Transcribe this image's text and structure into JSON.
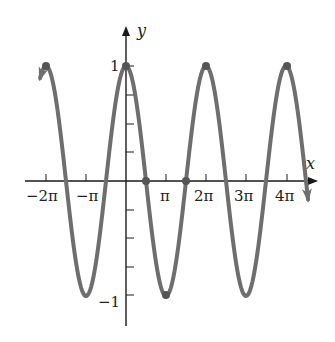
{
  "chart_data": {
    "type": "line",
    "title": "",
    "function": "y = cos(x)",
    "xlabel": "x",
    "ylabel": "y",
    "xlim": [
      -6.9,
      14.4
    ],
    "ylim": [
      -1.35,
      1.35
    ],
    "grid": false,
    "legend": null,
    "x_ticks": [
      {
        "value": -6.2832,
        "label": "−2π"
      },
      {
        "value": -3.1416,
        "label": "−π"
      },
      {
        "value": 3.1416,
        "label": "π"
      },
      {
        "value": 6.2832,
        "label": "2π"
      },
      {
        "value": 9.4248,
        "label": "3π"
      },
      {
        "value": 12.5664,
        "label": "4π"
      }
    ],
    "y_ticks": [
      {
        "value": 1,
        "label": "1"
      },
      {
        "value": 0.75,
        "label": ""
      },
      {
        "value": 0.5,
        "label": ""
      },
      {
        "value": 0.25,
        "label": ""
      },
      {
        "value": -0.25,
        "label": ""
      },
      {
        "value": -0.5,
        "label": ""
      },
      {
        "value": -0.75,
        "label": ""
      },
      {
        "value": -1,
        "label": "−1"
      }
    ],
    "series": [
      {
        "name": "cos(x)",
        "color": "#6e6e6e",
        "x_range": [
          -6.9,
          14.4
        ],
        "end_arrows": true
      }
    ],
    "highlighted_points": [
      {
        "x": -6.2832,
        "y": 1
      },
      {
        "x": 0,
        "y": 1
      },
      {
        "x": 1.5708,
        "y": 0
      },
      {
        "x": 3.1416,
        "y": -1
      },
      {
        "x": 4.7124,
        "y": 0
      },
      {
        "x": 6.2832,
        "y": 1
      },
      {
        "x": 12.5664,
        "y": 1
      }
    ]
  },
  "labels": {
    "x_axis": "x",
    "y_axis": "y",
    "y_one": "1",
    "y_neg_one": "−1",
    "x_ticks": [
      "−2π",
      "−π",
      "π",
      "2π",
      "3π",
      "4π"
    ]
  },
  "colors": {
    "curve": "#6e6e6e",
    "axis": "#1a1a1a",
    "dot": "#555555"
  }
}
